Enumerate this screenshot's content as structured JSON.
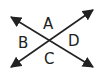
{
  "diagram": {
    "type": "intersecting-lines-angles",
    "lines": [
      {
        "name": "line-1",
        "direction": "top-left to bottom-right",
        "arrows": "both-ends"
      },
      {
        "name": "line-2",
        "direction": "bottom-left to top-right",
        "arrows": "both-ends"
      }
    ],
    "angle_labels": {
      "top": "A",
      "left": "B",
      "bottom": "C",
      "right": "D"
    },
    "stroke_color": "#222222",
    "background": "#ffffff"
  }
}
